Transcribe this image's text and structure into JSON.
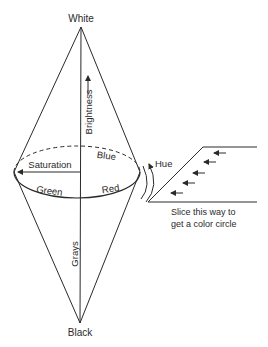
{
  "diagram": {
    "labels": {
      "top": "White",
      "bottom": "Black",
      "axis_upper": "Brightness",
      "axis_lower": "Grays",
      "saturation": "Saturation",
      "blue": "Blue",
      "green": "Green",
      "red": "Red",
      "hue": "Hue",
      "slice_line1": "Slice this way to",
      "slice_line2": "get a color circle"
    },
    "colors": {
      "stroke": "#2a2a2a",
      "background": "#ffffff"
    }
  }
}
